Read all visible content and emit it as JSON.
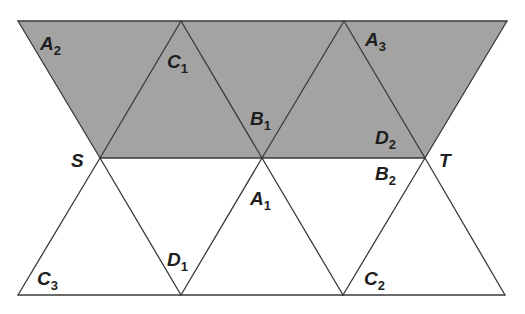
{
  "diagram": {
    "colors": {
      "shade": "#a3a3a3",
      "edge": "#3a3a3a",
      "text": "#1e1e1e",
      "background": "#ffffff"
    },
    "points": {
      "S": {
        "label": "S",
        "x": 100,
        "y": 158
      },
      "T": {
        "label": "T",
        "x": 425,
        "y": 158
      }
    },
    "labels": [
      {
        "id": "A2",
        "base": "A",
        "sub": "2",
        "x": 40,
        "y": 50
      },
      {
        "id": "C1",
        "base": "C",
        "sub": "1",
        "x": 167,
        "y": 68
      },
      {
        "id": "A3",
        "base": "A",
        "sub": "3",
        "x": 365,
        "y": 46
      },
      {
        "id": "B1",
        "base": "B",
        "sub": "1",
        "x": 250,
        "y": 125
      },
      {
        "id": "D2",
        "base": "D",
        "sub": "2",
        "x": 375,
        "y": 144
      },
      {
        "id": "S",
        "base": "S",
        "sub": "",
        "x": 71,
        "y": 167
      },
      {
        "id": "T",
        "base": "T",
        "sub": "",
        "x": 439,
        "y": 167
      },
      {
        "id": "B2",
        "base": "B",
        "sub": "2",
        "x": 375,
        "y": 180
      },
      {
        "id": "A1",
        "base": "A",
        "sub": "1",
        "x": 250,
        "y": 205
      },
      {
        "id": "D1",
        "base": "D",
        "sub": "1",
        "x": 167,
        "y": 266
      },
      {
        "id": "C3",
        "base": "C",
        "sub": "3",
        "x": 37,
        "y": 285
      },
      {
        "id": "C2",
        "base": "C",
        "sub": "2",
        "x": 364,
        "y": 285
      }
    ],
    "shaded_region": {
      "shape": "trapezoid",
      "vertices": [
        [
          18,
          21
        ],
        [
          507,
          21
        ],
        [
          425,
          158
        ],
        [
          100,
          158
        ]
      ]
    },
    "lines": {
      "top": {
        "y": 21,
        "x1": 18,
        "x2": 507
      },
      "middle": {
        "y": 158,
        "x1": 100,
        "x2": 425
      },
      "bottom": {
        "y": 295,
        "x1": 18,
        "x2": 505
      }
    }
  }
}
